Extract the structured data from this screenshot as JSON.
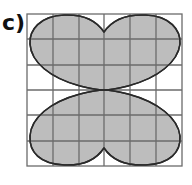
{
  "label": "c)",
  "grid": {
    "columns": 6,
    "rows": 6,
    "line_color": "#6b6b6b",
    "background": "#ffffff"
  },
  "shape": {
    "description": "Four-lobed butterfly-like shaded region made of curved arcs within a 6x6 square grid",
    "fill_color": "#bdbdbd",
    "stroke_color": "#2a2a2a"
  }
}
